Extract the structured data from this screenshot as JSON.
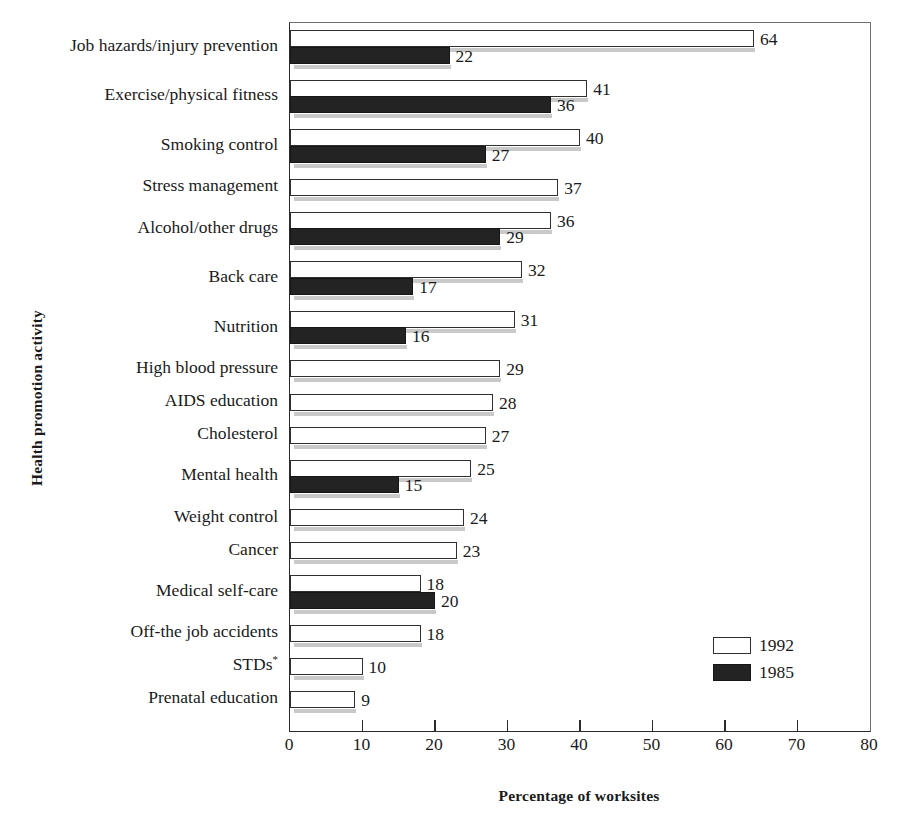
{
  "chart_data": {
    "type": "bar",
    "orientation": "horizontal",
    "title": "",
    "xlabel": "Percentage of worksites",
    "ylabel": "Health promotion activity",
    "xlim": [
      0,
      80
    ],
    "xticks": [
      0,
      10,
      20,
      30,
      40,
      50,
      60,
      70,
      80
    ],
    "grid": false,
    "legend_position": "lower-right",
    "footnote_marker": "*",
    "categories": [
      "Job hazards/injury prevention",
      "Exercise/physical fitness",
      "Smoking control",
      "Stress management",
      "Alcohol/other drugs",
      "Back care",
      "Nutrition",
      "High blood pressure",
      "AIDS education",
      "Cholesterol",
      "Mental health",
      "Weight control",
      "Cancer",
      "Medical self-care",
      "Off-the job accidents",
      "STDs",
      "Prenatal education"
    ],
    "series": [
      {
        "name": "1992",
        "style": "light",
        "values": [
          64,
          41,
          40,
          37,
          36,
          32,
          31,
          29,
          28,
          27,
          25,
          24,
          23,
          18,
          18,
          10,
          9
        ]
      },
      {
        "name": "1985",
        "style": "dark",
        "values": [
          22,
          36,
          27,
          null,
          29,
          17,
          16,
          null,
          null,
          null,
          15,
          null,
          null,
          20,
          null,
          null,
          null
        ]
      }
    ],
    "colors": {
      "series_1992_fill": "#ffffff",
      "series_1992_stroke": "#2f2f2f",
      "series_1985_fill": "#232323",
      "axis": "#2b2b2b",
      "text": "#1a1a1a",
      "shadow": "#c9c9c9"
    }
  },
  "legend": {
    "items": [
      {
        "label": "1992",
        "style": "light"
      },
      {
        "label": "1985",
        "style": "dark"
      }
    ]
  },
  "axes": {
    "x_title": "Percentage of worksites",
    "y_title": "Health promotion activity",
    "x_tick_labels": [
      "0",
      "10",
      "20",
      "30",
      "40",
      "50",
      "60",
      "70",
      "80"
    ]
  },
  "labels": {
    "categories": [
      {
        "text": "Job hazards/injury prevention",
        "superscript": ""
      },
      {
        "text": "Exercise/physical fitness",
        "superscript": ""
      },
      {
        "text": "Smoking control",
        "superscript": ""
      },
      {
        "text": "Stress management",
        "superscript": ""
      },
      {
        "text": "Alcohol/other drugs",
        "superscript": ""
      },
      {
        "text": "Back care",
        "superscript": ""
      },
      {
        "text": "Nutrition",
        "superscript": ""
      },
      {
        "text": "High blood pressure",
        "superscript": ""
      },
      {
        "text": "AIDS education",
        "superscript": ""
      },
      {
        "text": "Cholesterol",
        "superscript": ""
      },
      {
        "text": "Mental health",
        "superscript": ""
      },
      {
        "text": "Weight control",
        "superscript": ""
      },
      {
        "text": "Cancer",
        "superscript": ""
      },
      {
        "text": "Medical self-care",
        "superscript": ""
      },
      {
        "text": "Off-the job accidents",
        "superscript": ""
      },
      {
        "text": "STDs",
        "superscript": "*"
      },
      {
        "text": "Prenatal education",
        "superscript": ""
      }
    ]
  }
}
